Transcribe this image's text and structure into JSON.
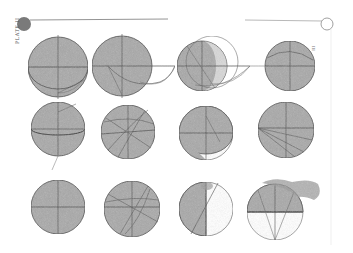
{
  "plate": {
    "label": "PLATE II",
    "side_label": "III",
    "colors": {
      "paper": "#ffffff",
      "shade": "#a9a9a9",
      "ink": "#444444",
      "blot": "#9a9a9a",
      "header_disk": "#7a7a7a"
    },
    "figures": [
      {
        "id": 1,
        "cx": 58,
        "cy": 67,
        "r": 30,
        "shading": "full",
        "extras": "lower-arc"
      },
      {
        "id": 2,
        "cx": 122,
        "cy": 66,
        "r": 30,
        "shading": "full",
        "extras": "long-arcs-right"
      },
      {
        "id": 3,
        "cx": 202,
        "cy": 66,
        "r": 25,
        "shading": "left-lune",
        "extras": "outer-circle-arcs"
      },
      {
        "id": 4,
        "cx": 290,
        "cy": 66,
        "r": 25,
        "shading": "full",
        "extras": "upper-arc"
      },
      {
        "id": 5,
        "cx": 58,
        "cy": 129,
        "r": 27,
        "shading": "full",
        "extras": "ellipse-arc"
      },
      {
        "id": 6,
        "cx": 128,
        "cy": 132,
        "r": 27,
        "shading": "full",
        "extras": "many-chords"
      },
      {
        "id": 7,
        "cx": 206,
        "cy": 133,
        "r": 27,
        "shading": "upper-with-white-crescent",
        "extras": "lower-crescent"
      },
      {
        "id": 8,
        "cx": 286,
        "cy": 130,
        "r": 28,
        "shading": "full",
        "extras": "fan-lines"
      },
      {
        "id": 9,
        "cx": 58,
        "cy": 207,
        "r": 27,
        "shading": "full",
        "extras": "cross-only"
      },
      {
        "id": 10,
        "cx": 132,
        "cy": 209,
        "r": 28,
        "shading": "full",
        "extras": "many-chords"
      },
      {
        "id": 11,
        "cx": 206,
        "cy": 209,
        "r": 27,
        "shading": "left-half",
        "extras": "diagonal"
      },
      {
        "id": 12,
        "cx": 275,
        "cy": 212,
        "r": 28,
        "shading": "upper-half",
        "extras": "triangle-blot"
      }
    ]
  }
}
